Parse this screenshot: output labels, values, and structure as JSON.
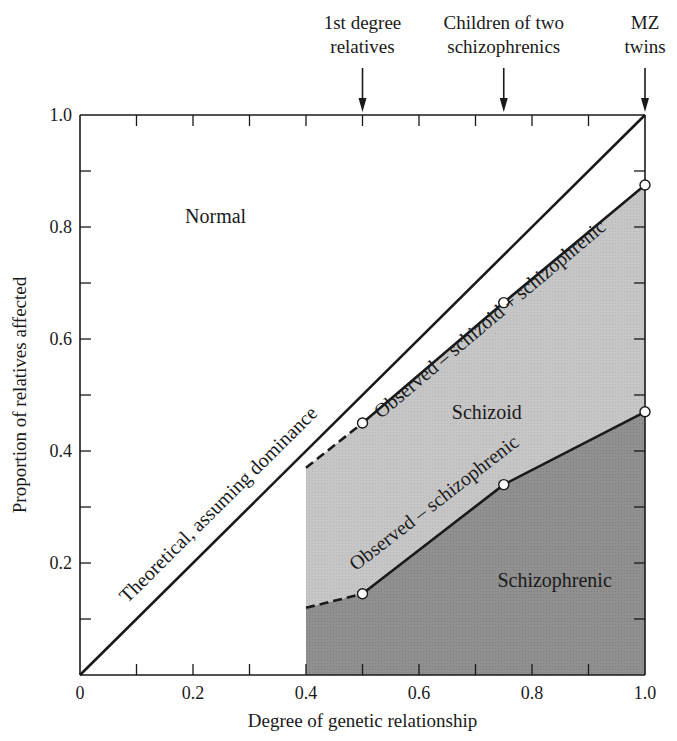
{
  "chart_data": {
    "type": "area",
    "title": "",
    "xlabel": "Degree of genetic relationship",
    "ylabel": "Proportion of relatives affected",
    "xlim": [
      0,
      1.0
    ],
    "ylim": [
      0,
      1.0
    ],
    "x_ticks": [
      0,
      0.1,
      0.2,
      0.3,
      0.4,
      0.5,
      0.6,
      0.7,
      0.8,
      0.9,
      1.0
    ],
    "x_tick_labels": [
      {
        "value": 0,
        "label": "0"
      },
      {
        "value": 0.2,
        "label": "0.2"
      },
      {
        "value": 0.4,
        "label": "0.4"
      },
      {
        "value": 0.6,
        "label": "0.6"
      },
      {
        "value": 0.8,
        "label": "0.8"
      },
      {
        "value": 1.0,
        "label": "1.0"
      }
    ],
    "y_ticks": [
      0.1,
      0.2,
      0.3,
      0.4,
      0.5,
      0.6,
      0.7,
      0.8,
      0.9,
      1.0
    ],
    "y_tick_labels": [
      {
        "value": 0.2,
        "label": "0.2"
      },
      {
        "value": 0.4,
        "label": "0.4"
      },
      {
        "value": 0.6,
        "label": "0.6"
      },
      {
        "value": 0.8,
        "label": "0.8"
      },
      {
        "value": 1.0,
        "label": "1.0"
      }
    ],
    "grid": false,
    "legend": null,
    "series": [
      {
        "name": "Theoretical, assuming dominance",
        "style": "solid",
        "x": [
          0,
          1.0
        ],
        "y": [
          0,
          1.0
        ]
      },
      {
        "name": "Observed – schizoid + schizophrenic",
        "style": "solid",
        "markers": "open-circle",
        "x": [
          0.5,
          0.75,
          1.0
        ],
        "y": [
          0.45,
          0.665,
          0.875
        ],
        "dashed_extension": {
          "x": [
            0.4,
            0.5
          ],
          "y": [
            0.37,
            0.45
          ]
        }
      },
      {
        "name": "Observed – schizophrenic",
        "style": "solid",
        "markers": "open-circle",
        "x": [
          0.5,
          0.75,
          1.0
        ],
        "y": [
          0.145,
          0.34,
          0.47
        ],
        "dashed_extension": {
          "x": [
            0.4,
            0.5
          ],
          "y": [
            0.12,
            0.145
          ]
        }
      }
    ],
    "regions": [
      {
        "name": "Normal",
        "fill": "#ffffff"
      },
      {
        "name": "Schizoid",
        "fill": "#c4c4c4",
        "between": [
          "Observed – schizophrenic",
          "Observed – schizoid + schizophrenic"
        ],
        "x_range": [
          0.4,
          1.0
        ]
      },
      {
        "name": "Schizophrenic",
        "fill": "#8e8e8e",
        "between": [
          "x-axis",
          "Observed – schizophrenic"
        ],
        "x_range": [
          0.4,
          1.0
        ]
      }
    ],
    "annotations": [
      {
        "text": "1st degree relatives",
        "lines": [
          "1st degree",
          "relatives"
        ],
        "x": 0.5,
        "arrow": "down"
      },
      {
        "text": "Children of two schizophrenics",
        "lines": [
          "Children of two",
          "schizophrenics"
        ],
        "x": 0.75,
        "arrow": "down"
      },
      {
        "text": "MZ twins",
        "lines": [
          "MZ",
          "twins"
        ],
        "x": 1.0,
        "arrow": "down"
      }
    ],
    "region_labels": [
      {
        "text": "Normal",
        "x": 0.24,
        "y": 0.82
      },
      {
        "text": "Schizoid",
        "x": 0.72,
        "y": 0.47
      },
      {
        "text": "Schizophrenic",
        "x": 0.84,
        "y": 0.17
      }
    ],
    "line_labels": [
      {
        "text": "Theoretical, assuming dominance",
        "series": 0
      },
      {
        "text": "Observed – schizoid + schizophrenic",
        "series": 1
      },
      {
        "text": "Observed – schizophrenic",
        "series": 2
      }
    ]
  },
  "colors": {
    "ink": "#1a1a1a",
    "schizoid_fill": "#c4c4c4",
    "schizophrenic_fill": "#8e8e8e",
    "background": "#ffffff"
  }
}
